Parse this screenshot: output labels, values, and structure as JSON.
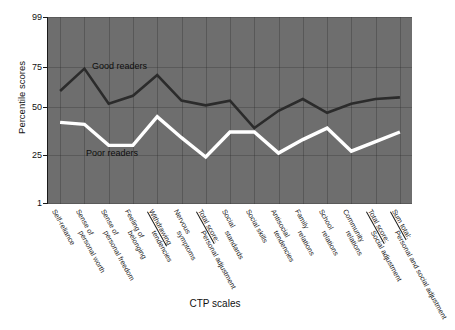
{
  "chart_data": {
    "type": "line",
    "title": "",
    "xlabel": "CTP scales",
    "ylabel": "Percentile scores",
    "ylim": [
      1,
      99
    ],
    "yticks": [
      99,
      75,
      50,
      25,
      1
    ],
    "grid": true,
    "legend_position": "inline-annotation",
    "categories": [
      "Self-reliance",
      "Sense of personal worth",
      "Sense of personal freedom",
      "Feeling of belonging",
      "Withdrawing tendencies",
      "Nervous symptoms",
      "Total score: Personal adjustment",
      "Social standards",
      "Social skills",
      "Antisocial tendencies",
      "Family relations",
      "School relations",
      "Community relations",
      "Total score: Social adjustment",
      "Sum total: Personal and social adjustment"
    ],
    "series": [
      {
        "name": "Good readers",
        "color": "#2b2b2b",
        "values": [
          60,
          74,
          52,
          57,
          70,
          54,
          51,
          54,
          39,
          48,
          55,
          47,
          52,
          55,
          56
        ]
      },
      {
        "name": "Poor readers",
        "color": "#ffffff",
        "values": [
          42,
          41,
          30,
          30,
          45,
          34,
          24,
          37,
          37,
          26,
          33,
          39,
          27,
          32,
          37
        ]
      }
    ],
    "annotations": [
      {
        "text": "Good readers",
        "x_px": 92,
        "y_px": 61
      },
      {
        "text": "Poor readers",
        "x_px": 86,
        "y_px": 148
      }
    ],
    "panel_background": "#6e6e6e",
    "figure_background": "#ffffff"
  },
  "axis": {
    "y_tick_labels": [
      "99",
      "75",
      "50",
      "25",
      "1"
    ],
    "y_title": "Percentile scores",
    "x_title": "CTP scales"
  },
  "x_labels": [
    {
      "line1": "Self-reliance",
      "line2": "",
      "underline": false
    },
    {
      "line1": "Sense of",
      "line2": "personal worth",
      "underline": false
    },
    {
      "line1": "Sense of",
      "line2": "personal freedom",
      "underline": false
    },
    {
      "line1": "Feeling of",
      "line2": "belonging",
      "underline": false
    },
    {
      "line1": "Withdrawing",
      "line2": "tendencies",
      "underline": true
    },
    {
      "line1": "Nervous",
      "line2": "symptoms",
      "underline": false
    },
    {
      "line1": "Total score:",
      "line2": "Personal adjustment",
      "underline": true
    },
    {
      "line1": "Social",
      "line2": "standards",
      "underline": false
    },
    {
      "line1": "Social skills",
      "line2": "",
      "underline": false
    },
    {
      "line1": "Antisocial",
      "line2": "tendencies",
      "underline": false
    },
    {
      "line1": "Family",
      "line2": "relations",
      "underline": false
    },
    {
      "line1": "School",
      "line2": "relations",
      "underline": false
    },
    {
      "line1": "Community",
      "line2": "relations",
      "underline": false
    },
    {
      "line1": "Total score:",
      "line2": "Social adjustment",
      "underline": true
    },
    {
      "line1": "Sum total:",
      "line2": "Personal and social adjustment",
      "underline": true
    }
  ],
  "series_labels": {
    "good": "Good readers",
    "poor": "Poor readers"
  }
}
